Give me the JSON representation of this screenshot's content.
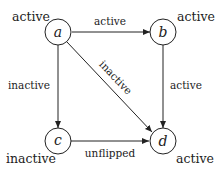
{
  "diagram": {
    "nodes": [
      {
        "id": "a",
        "label": "a",
        "state": "active"
      },
      {
        "id": "b",
        "label": "b",
        "state": "active"
      },
      {
        "id": "c",
        "label": "c",
        "state": "inactive"
      },
      {
        "id": "d",
        "label": "d",
        "state": "active"
      }
    ],
    "edges": [
      {
        "from": "a",
        "to": "b",
        "label": "active"
      },
      {
        "from": "a",
        "to": "c",
        "label": "inactive"
      },
      {
        "from": "a",
        "to": "d",
        "label": "inactive"
      },
      {
        "from": "b",
        "to": "d",
        "label": "active"
      },
      {
        "from": "c",
        "to": "d",
        "label": "unflipped"
      }
    ],
    "colors": {
      "stroke": "#222222",
      "background": "#ffffff"
    }
  }
}
